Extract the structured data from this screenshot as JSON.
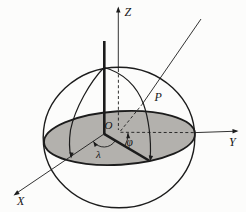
{
  "figure": {
    "labels": {
      "axis_z": "Z",
      "axis_y": "Y",
      "axis_x": "X",
      "origin": "O",
      "point": "P",
      "longitude_angle": "λ",
      "latitude_angle": "φ"
    },
    "colors": {
      "line": "#1c1c1c",
      "equator_fill": "#b3b1ad",
      "background": "#fcfcfb"
    }
  }
}
